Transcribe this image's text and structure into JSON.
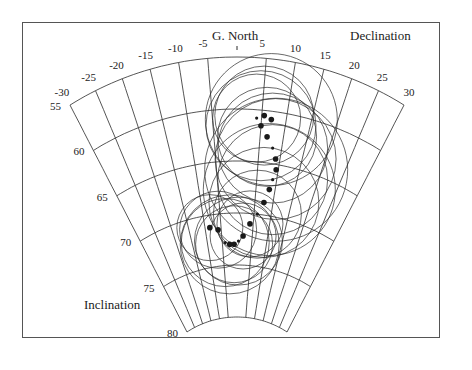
{
  "figure": {
    "north_label": "G. North",
    "declination_label": "Declination",
    "inclination_label": "Inclination",
    "declination_ticks": [
      "-30",
      "-25",
      "-20",
      "-15",
      "-10",
      "-5",
      "5",
      "10",
      "15",
      "20",
      "25",
      "30"
    ],
    "inclination_ticks": [
      "55",
      "60",
      "65",
      "70",
      "75",
      "80"
    ],
    "colors": {
      "ink": "#2a2a2a",
      "background": "#ffffff",
      "frame": "#555555"
    }
  },
  "chart_data": {
    "type": "scatter",
    "title": "",
    "projection": "polar fan (declination vs inclination)",
    "xlabel": "Declination",
    "ylabel": "Inclination",
    "xlim": [
      -30,
      30
    ],
    "ylim": [
      55,
      80
    ],
    "x_ticks": [
      -30,
      -25,
      -20,
      -15,
      -10,
      -5,
      0,
      5,
      10,
      15,
      20,
      25,
      30
    ],
    "y_ticks": [
      55,
      60,
      65,
      70,
      75,
      80
    ],
    "grid": true,
    "series": [
      {
        "name": "VGP path (declination, inclination) with alpha95 circles",
        "points": [
          {
            "dec": -8.5,
            "inc": 71.2,
            "a95": 3.0
          },
          {
            "dec": -6.0,
            "inc": 71.5,
            "a95": 3.5
          },
          {
            "dec": -4.0,
            "inc": 72.8,
            "a95": 4.0
          },
          {
            "dec": -2.5,
            "inc": 73.0,
            "a95": 4.5
          },
          {
            "dec": -1.0,
            "inc": 73.0,
            "a95": 3.5
          },
          {
            "dec": 0.5,
            "inc": 72.7,
            "a95": 4.0
          },
          {
            "dec": 2.0,
            "inc": 72.2,
            "a95": 3.0
          },
          {
            "dec": 4.0,
            "inc": 71.0,
            "a95": 3.0
          },
          {
            "dec": 6.0,
            "inc": 70.0,
            "a95": 4.0
          },
          {
            "dec": 7.5,
            "inc": 68.8,
            "a95": 5.0
          },
          {
            "dec": 8.5,
            "inc": 67.5,
            "a95": 6.0
          },
          {
            "dec": 9.0,
            "inc": 66.5,
            "a95": 5.0
          },
          {
            "dec": 9.5,
            "inc": 65.5,
            "a95": 6.5
          },
          {
            "dec": 9.0,
            "inc": 64.5,
            "a95": 5.5
          },
          {
            "dec": 8.0,
            "inc": 63.5,
            "a95": 5.0
          },
          {
            "dec": 6.5,
            "inc": 62.5,
            "a95": 4.5
          },
          {
            "dec": 5.0,
            "inc": 61.5,
            "a95": 5.0
          },
          {
            "dec": 4.0,
            "inc": 60.8,
            "a95": 4.0
          },
          {
            "dec": 5.5,
            "inc": 60.5,
            "a95": 4.5
          },
          {
            "dec": 7.0,
            "inc": 60.8,
            "a95": 6.0
          }
        ]
      }
    ]
  }
}
